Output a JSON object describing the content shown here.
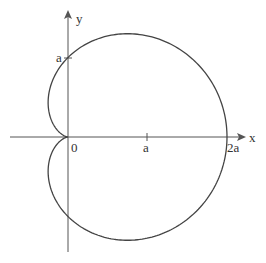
{
  "diagram": {
    "curve": {
      "type": "cardioid",
      "equation": "r = a(1 + cos θ)",
      "color": "#444444"
    },
    "axes": {
      "x_label": "x",
      "y_label": "y",
      "color": "#555555"
    },
    "labels": {
      "origin": "0",
      "x_tick_a": "a",
      "x_tick_2a": "2a",
      "y_tick_a": "a"
    }
  }
}
